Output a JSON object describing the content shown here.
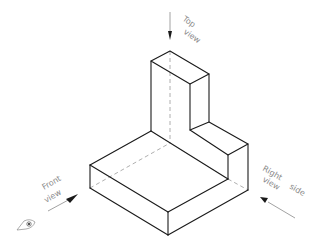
{
  "diagram": {
    "type": "isometric-projection",
    "object": "L-shaped block with stepped upright",
    "labels": {
      "top": {
        "line1": "Top",
        "line2": "view"
      },
      "front": {
        "line1": "Front",
        "line2": "view"
      },
      "right": {
        "line1": "Right",
        "line2": "view",
        "extra": "side"
      }
    },
    "colors": {
      "edge": "#1a1a1a",
      "hidden": "#9a9a9a",
      "annotation": "#8a8a8a"
    },
    "icons": [
      "eye-icon",
      "arrow-down-icon",
      "arrow-front-icon",
      "arrow-right-side-icon"
    ]
  }
}
